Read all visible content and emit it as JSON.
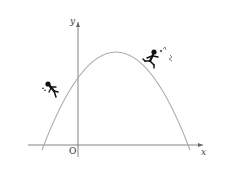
{
  "diagram": {
    "type": "parabola-graph",
    "axes": {
      "x_label": "x",
      "y_label": "y",
      "origin_label": "O",
      "axis_color": "#666666"
    },
    "curve": {
      "shape": "downward-opening parabola",
      "color": "#aaaaaa",
      "vertex_position": "right of y-axis, above x-axis",
      "y_intercept": "positive",
      "roots": "one negative, one positive"
    },
    "figures": [
      {
        "name": "running-person",
        "position": "on curve, right of vertex",
        "color": "#111111"
      },
      {
        "name": "falling-person",
        "position": "left of curve, left of y-axis",
        "color": "#111111"
      }
    ]
  }
}
